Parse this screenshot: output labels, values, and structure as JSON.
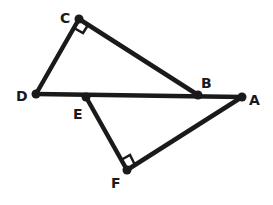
{
  "diagram": {
    "stroke_color": "#1a1a1a",
    "background": "#ffffff",
    "points": {
      "A": {
        "label": "A",
        "x": 242,
        "y": 97,
        "lx": 249,
        "ly": 105
      },
      "B": {
        "label": "B",
        "x": 198,
        "y": 95,
        "lx": 201,
        "ly": 88
      },
      "C": {
        "label": "C",
        "x": 79,
        "y": 19,
        "lx": 60,
        "ly": 23
      },
      "D": {
        "label": "D",
        "x": 36,
        "y": 94,
        "lx": 16,
        "ly": 101
      },
      "E": {
        "label": "E",
        "x": 86,
        "y": 97,
        "lx": 73,
        "ly": 119
      },
      "F": {
        "label": "F",
        "x": 127,
        "y": 170,
        "lx": 111,
        "ly": 188
      }
    },
    "segments": [
      [
        "D",
        "A"
      ],
      [
        "D",
        "C"
      ],
      [
        "C",
        "B"
      ],
      [
        "E",
        "F"
      ],
      [
        "F",
        "A"
      ]
    ],
    "right_angles": [
      "C",
      "F"
    ]
  }
}
